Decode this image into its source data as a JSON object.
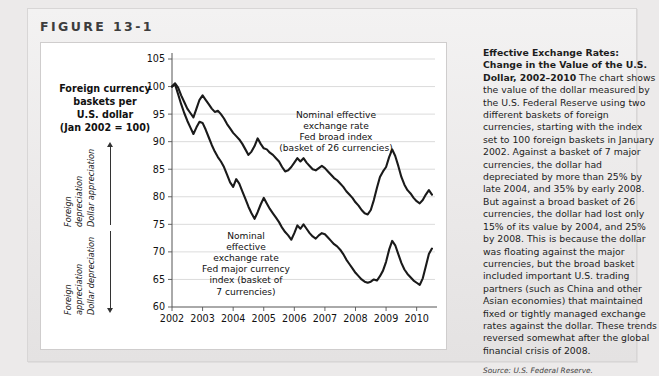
{
  "figure": {
    "label": "FIGURE",
    "number": "13-1"
  },
  "axis_title": {
    "line1": "Foreign currency",
    "line2": "baskets per",
    "line3": "U.S. dollar",
    "line4": "(Jan 2002 = 100)"
  },
  "annotations": {
    "upper": {
      "line1": "Foreign",
      "line2": "depreciation",
      "line3": "Dollar appreciation"
    },
    "lower": {
      "line1": "Foreign",
      "line2": "appreciation",
      "line3": "Dollar depreciation"
    }
  },
  "series_labels": {
    "broad": {
      "line1": "Nominal effective",
      "line2": "exchange rate",
      "line3": "Fed broad index",
      "line4": "(basket of 26 currencies)"
    },
    "major": {
      "line1": "Nominal",
      "line2": "effective",
      "line3": "exchange rate",
      "line4": "Fed major currency",
      "line5": "index (basket of",
      "line6": "7 currencies)"
    }
  },
  "caption": {
    "title": "Effective Exchange Rates: Change in the Value of the U.S. Dollar, 2002–2010",
    "body": " The chart shows the value of the dollar measured by the U.S. Federal Reserve using two different baskets of foreign currencies, starting with the index set to 100 foreign baskets in January 2002. Against a basket of 7 major currencies, the dollar had depreciated by more than 25% by late 2004, and 35% by early 2008. But against a broad basket of 26 currencies, the dollar had lost only 15% of its value by 2004, and 25% by 2008. This is because the dollar was floating against the major currencies, but the broad basket included important U.S. trading partners (such as China and other Asian economies) that maintained fixed or tightly managed exchange rates against the dollar. These trends reversed somewhat after the global financial crisis of 2008.",
    "source": "Source: U.S. Federal Reserve."
  },
  "chart_data": {
    "type": "line",
    "title": "Effective Exchange Rates: Change in the Value of the U.S. Dollar, 2002–2010",
    "xlabel": "",
    "ylabel": "Foreign currency baskets per U.S. dollar (Jan 2002 = 100)",
    "xlim": [
      2002.0,
      2010.6
    ],
    "ylim": [
      60,
      105
    ],
    "yticks": [
      60,
      65,
      70,
      75,
      80,
      85,
      90,
      95,
      100,
      105
    ],
    "xticks": [
      2002,
      2003,
      2004,
      2005,
      2006,
      2007,
      2008,
      2009,
      2010
    ],
    "grid": "horizontal",
    "legend": "inline-annotation",
    "series": [
      {
        "name": "Nominal effective exchange rate Fed broad index (basket of 26 currencies)",
        "color": "#1a1a1a",
        "x": [
          2002.0,
          2002.1,
          2002.2,
          2002.3,
          2002.4,
          2002.5,
          2002.6,
          2002.7,
          2002.8,
          2002.9,
          2003.0,
          2003.1,
          2003.2,
          2003.3,
          2003.4,
          2003.5,
          2003.6,
          2003.7,
          2003.8,
          2003.9,
          2004.0,
          2004.1,
          2004.2,
          2004.3,
          2004.4,
          2004.5,
          2004.6,
          2004.7,
          2004.8,
          2004.9,
          2005.0,
          2005.1,
          2005.2,
          2005.3,
          2005.4,
          2005.5,
          2005.6,
          2005.7,
          2005.8,
          2005.9,
          2006.0,
          2006.1,
          2006.2,
          2006.3,
          2006.4,
          2006.5,
          2006.6,
          2006.7,
          2006.8,
          2006.9,
          2007.0,
          2007.1,
          2007.2,
          2007.3,
          2007.4,
          2007.5,
          2007.6,
          2007.7,
          2007.8,
          2007.9,
          2008.0,
          2008.1,
          2008.2,
          2008.3,
          2008.4,
          2008.5,
          2008.6,
          2008.7,
          2008.8,
          2008.9,
          2009.0,
          2009.1,
          2009.2,
          2009.3,
          2009.4,
          2009.5,
          2009.6,
          2009.7,
          2009.8,
          2009.9,
          2010.0,
          2010.1,
          2010.2,
          2010.3,
          2010.4,
          2010.5
        ],
        "y": [
          100.0,
          100.6,
          99.8,
          98.4,
          97.2,
          96.0,
          95.2,
          94.4,
          96.0,
          97.6,
          98.4,
          97.6,
          96.8,
          96.0,
          95.4,
          95.6,
          95.0,
          94.2,
          93.2,
          92.4,
          91.6,
          91.0,
          90.4,
          89.6,
          88.6,
          87.6,
          88.2,
          89.2,
          90.6,
          89.6,
          88.8,
          88.6,
          88.0,
          87.6,
          87.0,
          86.4,
          85.4,
          84.6,
          84.8,
          85.4,
          86.2,
          87.0,
          86.4,
          87.0,
          86.2,
          85.6,
          85.0,
          84.8,
          85.2,
          85.6,
          85.2,
          84.6,
          84.0,
          83.4,
          83.0,
          82.4,
          81.8,
          81.0,
          80.4,
          79.8,
          79.0,
          78.4,
          77.6,
          77.0,
          76.8,
          77.6,
          79.4,
          81.6,
          83.6,
          84.6,
          85.4,
          87.2,
          88.6,
          87.4,
          85.6,
          83.6,
          82.2,
          81.2,
          80.6,
          79.8,
          79.2,
          78.8,
          79.4,
          80.4,
          81.2,
          80.4
        ]
      },
      {
        "name": "Nominal effective exchange rate Fed major currency index (basket of 7 currencies)",
        "color": "#1a1a1a",
        "x": [
          2002.0,
          2002.1,
          2002.2,
          2002.3,
          2002.4,
          2002.5,
          2002.6,
          2002.7,
          2002.8,
          2002.9,
          2003.0,
          2003.1,
          2003.2,
          2003.3,
          2003.4,
          2003.5,
          2003.6,
          2003.7,
          2003.8,
          2003.9,
          2004.0,
          2004.1,
          2004.2,
          2004.3,
          2004.4,
          2004.5,
          2004.6,
          2004.7,
          2004.8,
          2004.9,
          2005.0,
          2005.1,
          2005.2,
          2005.3,
          2005.4,
          2005.5,
          2005.6,
          2005.7,
          2005.8,
          2005.9,
          2006.0,
          2006.1,
          2006.2,
          2006.3,
          2006.4,
          2006.5,
          2006.6,
          2006.7,
          2006.8,
          2006.9,
          2007.0,
          2007.1,
          2007.2,
          2007.3,
          2007.4,
          2007.5,
          2007.6,
          2007.7,
          2007.8,
          2007.9,
          2008.0,
          2008.1,
          2008.2,
          2008.3,
          2008.4,
          2008.5,
          2008.6,
          2008.7,
          2008.8,
          2008.9,
          2009.0,
          2009.1,
          2009.2,
          2009.3,
          2009.4,
          2009.5,
          2009.6,
          2009.7,
          2009.8,
          2009.9,
          2010.0,
          2010.1,
          2010.2,
          2010.3,
          2010.4,
          2010.5
        ],
        "y": [
          100.0,
          100.4,
          98.6,
          96.8,
          95.2,
          93.8,
          92.6,
          91.4,
          92.6,
          93.6,
          93.4,
          92.2,
          90.8,
          89.4,
          88.2,
          87.2,
          86.4,
          85.4,
          84.0,
          82.6,
          81.8,
          83.2,
          82.4,
          81.0,
          79.6,
          78.2,
          77.0,
          76.0,
          77.2,
          78.6,
          79.8,
          78.8,
          77.8,
          77.0,
          76.2,
          75.4,
          74.4,
          73.6,
          73.0,
          72.2,
          73.4,
          74.8,
          74.2,
          75.0,
          74.2,
          73.4,
          72.8,
          72.4,
          73.0,
          73.4,
          73.2,
          72.6,
          72.0,
          71.4,
          71.0,
          70.4,
          69.6,
          68.6,
          67.8,
          67.0,
          66.2,
          65.6,
          65.0,
          64.6,
          64.4,
          64.6,
          65.0,
          64.8,
          65.6,
          66.6,
          68.2,
          70.4,
          72.0,
          71.2,
          69.6,
          68.0,
          66.8,
          66.0,
          65.4,
          64.8,
          64.4,
          64.0,
          65.2,
          67.4,
          69.6,
          70.6
        ]
      }
    ]
  }
}
